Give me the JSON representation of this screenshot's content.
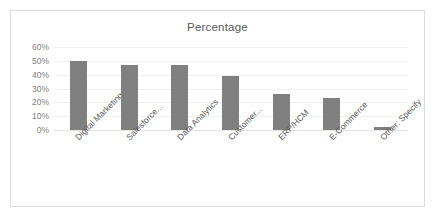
{
  "chart_data": {
    "type": "bar",
    "title": "Percentage",
    "xlabel": "",
    "ylabel": "",
    "ylim": [
      0,
      60
    ],
    "ytick_step": 10,
    "ytick_labels": [
      "0%",
      "10%",
      "20%",
      "30%",
      "40%",
      "50%",
      "60%"
    ],
    "ytick_values": [
      0,
      10,
      20,
      30,
      40,
      50,
      60
    ],
    "grid": true,
    "legend": false,
    "categories": [
      "Digital Marketing",
      "Salesforce...",
      "Data Analytics",
      "Customer...",
      "ERP/HCM",
      "E-Commerce",
      "Other: Specify"
    ],
    "values": [
      50,
      47,
      47,
      39,
      26,
      23,
      2
    ],
    "bar_color": "#808080",
    "plot_background": "#ffffff",
    "border_color": "#dcdcdc",
    "gridline_color": "#f2f2f2",
    "tick_label_color": "#7f7f7f",
    "title_color": "#595959"
  }
}
